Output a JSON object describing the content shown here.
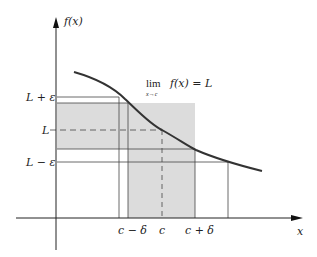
{
  "diagram": {
    "y_axis_label": "f(x)",
    "x_axis_label": "x",
    "limit_statement": {
      "lim": "lim",
      "subscript": "x→c",
      "expression": "f(x) = L"
    },
    "y_ticks": [
      {
        "label": "L + ε",
        "role": "L-plus-epsilon"
      },
      {
        "label": "L",
        "role": "L"
      },
      {
        "label": "L − ε",
        "role": "L-minus-epsilon"
      }
    ],
    "x_ticks": [
      {
        "label": "c − δ",
        "role": "c-minus-delta"
      },
      {
        "label": "c",
        "role": "c"
      },
      {
        "label": "c + δ",
        "role": "c-plus-delta"
      }
    ],
    "colors": {
      "line": "#2a2a2a",
      "curve": "#333333",
      "shade": "#d9d9d9",
      "background": "#ffffff"
    }
  }
}
